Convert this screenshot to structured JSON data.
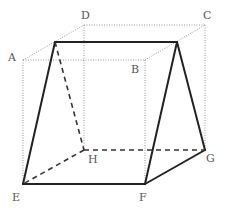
{
  "diagram": {
    "type": "cube-with-inscribed-solid",
    "labels": {
      "A": "A",
      "B": "B",
      "C": "C",
      "D": "D",
      "E": "E",
      "F": "F",
      "G": "G",
      "H": "H"
    },
    "colors": {
      "cube_edges": "#999999",
      "solid_edges": "#222222",
      "hidden_edges": "#333333"
    }
  }
}
